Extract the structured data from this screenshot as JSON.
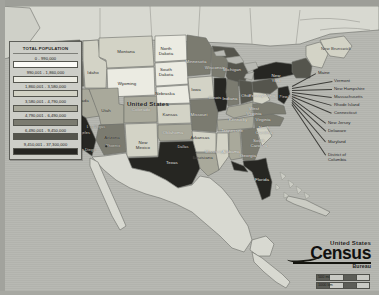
{
  "map": {
    "title_on_map": "United States",
    "legend": {
      "title": "TOTAL POPULATION",
      "classes": [
        {
          "range": "0 - 990,000",
          "color": "#fbfbf7"
        },
        {
          "range": "990,001 - 1,860,000",
          "color": "#ebebe2"
        },
        {
          "range": "1,860,001 - 3,580,000",
          "color": "#d3d3c6"
        },
        {
          "range": "3,580,001 - 4,790,000",
          "color": "#a9a99b"
        },
        {
          "range": "4,790,001 - 6,490,000",
          "color": "#7b7b70"
        },
        {
          "range": "6,490,001 - 9,450,000",
          "color": "#55554d"
        },
        {
          "range": "9,450,001 - 37,300,000",
          "color": "#262622"
        }
      ]
    },
    "logo": {
      "line1": "United States",
      "line2": "Census",
      "line3": "Bureau"
    },
    "scale": {
      "miles": "500 mi",
      "kilometers": "1000 km"
    },
    "neighbors": [
      {
        "name": "New Brunswick"
      }
    ],
    "state_labels": [
      {
        "name": "Washington",
        "x": 62,
        "y": 52,
        "tone": "lt"
      },
      {
        "name": "Oregon",
        "x": 58,
        "y": 73,
        "tone": "dk"
      },
      {
        "name": "Nevada",
        "x": 81,
        "y": 101,
        "tone": "dk"
      },
      {
        "name": "Idaho",
        "x": 93,
        "y": 73,
        "tone": "dk"
      },
      {
        "name": "Montana",
        "x": 126,
        "y": 52,
        "tone": "dk"
      },
      {
        "name": "Wyoming",
        "x": 127,
        "y": 84,
        "tone": "dk"
      },
      {
        "name": "Utah",
        "x": 106,
        "y": 111,
        "tone": "dk"
      },
      {
        "name": "California",
        "x": 72,
        "y": 123,
        "tone": "lt"
      },
      {
        "name": "Arizona",
        "x": 112,
        "y": 138,
        "tone": "dk"
      },
      {
        "name": "New Mexico",
        "x": 143,
        "y": 146,
        "tone": "dk"
      },
      {
        "name": "Colorado",
        "x": 141,
        "y": 110,
        "tone": "lt"
      },
      {
        "name": "North Dakota",
        "x": 166,
        "y": 52,
        "tone": "dk"
      },
      {
        "name": "South Dakota",
        "x": 166,
        "y": 73,
        "tone": "dk"
      },
      {
        "name": "Nebraska",
        "x": 165,
        "y": 94,
        "tone": "dk"
      },
      {
        "name": "Kansas",
        "x": 170,
        "y": 115,
        "tone": "dk"
      },
      {
        "name": "Oklahoma",
        "x": 173,
        "y": 133,
        "tone": "lt"
      },
      {
        "name": "Texas",
        "x": 172,
        "y": 163,
        "tone": "lt"
      },
      {
        "name": "Minnesota",
        "x": 196,
        "y": 62,
        "tone": "lt"
      },
      {
        "name": "Iowa",
        "x": 196,
        "y": 90,
        "tone": "dk"
      },
      {
        "name": "Missouri",
        "x": 199,
        "y": 115,
        "tone": "lt"
      },
      {
        "name": "Arkansas",
        "x": 200,
        "y": 138,
        "tone": "dk"
      },
      {
        "name": "Louisiana",
        "x": 203,
        "y": 158,
        "tone": "dk"
      },
      {
        "name": "Wisconsin",
        "x": 215,
        "y": 68,
        "tone": "lt"
      },
      {
        "name": "Illinois",
        "x": 215,
        "y": 98,
        "tone": "lt"
      },
      {
        "name": "Mississippi",
        "x": 216,
        "y": 152,
        "tone": "lt"
      },
      {
        "name": "Michigan",
        "x": 232,
        "y": 70,
        "tone": "lt"
      },
      {
        "name": "Indiana",
        "x": 230,
        "y": 99,
        "tone": "lt"
      },
      {
        "name": "Tennessee",
        "x": 232,
        "y": 131,
        "tone": "lt"
      },
      {
        "name": "Alabama",
        "x": 231,
        "y": 152,
        "tone": "lt"
      },
      {
        "name": "Kentucky",
        "x": 238,
        "y": 120,
        "tone": "lt"
      },
      {
        "name": "Ohio",
        "x": 246,
        "y": 96,
        "tone": "lt"
      },
      {
        "name": "Georgia",
        "x": 248,
        "y": 156,
        "tone": "lt"
      },
      {
        "name": "Florida",
        "x": 262,
        "y": 180,
        "tone": "lt"
      },
      {
        "name": "West Virginia",
        "x": 254,
        "y": 112,
        "tone": "lt"
      },
      {
        "name": "Virginia",
        "x": 263,
        "y": 120,
        "tone": "lt"
      },
      {
        "name": "North Carolina",
        "x": 264,
        "y": 131,
        "tone": "lt"
      },
      {
        "name": "South Carolina",
        "x": 259,
        "y": 144,
        "tone": "lt"
      },
      {
        "name": "Pennsylvania",
        "x": 262,
        "y": 96,
        "tone": "lt"
      },
      {
        "name": "New York",
        "x": 276,
        "y": 79,
        "tone": "lt"
      }
    ],
    "callouts": [
      {
        "name": "Maine",
        "x": 318,
        "y": 73
      },
      {
        "name": "Vermont",
        "x": 334,
        "y": 81
      },
      {
        "name": "New Hampshire",
        "x": 334,
        "y": 89
      },
      {
        "name": "Massachusetts",
        "x": 334,
        "y": 97
      },
      {
        "name": "Rhode Island",
        "x": 334,
        "y": 105
      },
      {
        "name": "Connecticut",
        "x": 334,
        "y": 113
      },
      {
        "name": "New Jersey",
        "x": 328,
        "y": 123
      },
      {
        "name": "Delaware",
        "x": 328,
        "y": 131
      },
      {
        "name": "Maryland",
        "x": 328,
        "y": 142
      },
      {
        "name": "District of\nColumbia",
        "x": 328,
        "y": 155
      }
    ],
    "city_labels": [
      {
        "name": "Los Angeles",
        "x": 79,
        "y": 133,
        "tone": "lt"
      },
      {
        "name": "San Diego",
        "x": 86,
        "y": 150,
        "tone": "lt"
      },
      {
        "name": "Las Vegas",
        "x": 96,
        "y": 127,
        "tone": "lt"
      },
      {
        "name": "Phoenix",
        "x": 113,
        "y": 146,
        "tone": "lt"
      },
      {
        "name": "Dallas",
        "x": 183,
        "y": 147,
        "tone": "lt"
      },
      {
        "name": "New York",
        "x": 288,
        "y": 97,
        "tone": "lt"
      }
    ]
  }
}
